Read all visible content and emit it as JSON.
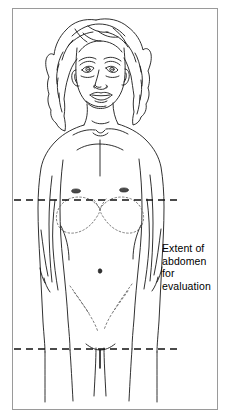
{
  "figure": {
    "title": "Extent of abdomen for evaluation",
    "background_color": "#ffffff",
    "frame": {
      "border_color": "#9a9a9a",
      "border_width_px": 1,
      "x": 12,
      "y": 8,
      "width": 206,
      "height": 402
    }
  },
  "annotation": {
    "text": "Extent of\nabdomen\nfor\nevaluation",
    "lines": [
      "Extent of",
      "abdomen",
      "for",
      "evaluation"
    ],
    "color": "#000000",
    "font_size_px": 10.5,
    "x": 162,
    "y": 242
  },
  "boundary_lines": [
    {
      "name": "upper-boundary",
      "description": "upper dashed boundary at the nipple / costal line",
      "y": 200,
      "x_start": 14,
      "x_end": 182,
      "style": "dashed",
      "color": "#111111",
      "width_px": 1.6,
      "dash_pattern": "7 5"
    },
    {
      "name": "lower-boundary",
      "description": "lower dashed boundary at the symphysis pubis / groin line",
      "y": 349,
      "x_start": 14,
      "x_end": 182,
      "style": "dashed",
      "color": "#111111",
      "width_px": 1.6,
      "dash_pattern": "7 5"
    }
  ],
  "anatomy": {
    "line_color": "#1a1a1a",
    "dotted_color": "#707070",
    "parts": [
      "hair",
      "face",
      "eyes",
      "nose",
      "mouth",
      "ears",
      "neck",
      "clavicles",
      "shoulders",
      "left-arm",
      "right-arm",
      "chest",
      "nipples",
      "costal-margin",
      "abdomen",
      "navel",
      "inguinal-creases",
      "pubic-region",
      "legs"
    ]
  }
}
